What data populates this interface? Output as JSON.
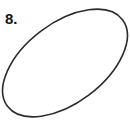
{
  "figure": {
    "background_color": "#ffffff",
    "width": 130,
    "height": 130,
    "item_label": "8.",
    "item_label_color": "#141414",
    "shape": {
      "name": "ellipse",
      "stroke_color": "#2b2b2b",
      "stroke_width": 1.6,
      "fill": "none",
      "center_x": 65,
      "center_y": 63,
      "semi_major_axis": 72,
      "semi_minor_axis": 40,
      "rotation_degrees": -37,
      "bounding_box": {
        "left": 5,
        "top": 3,
        "right": 125,
        "bottom": 123
      }
    }
  }
}
